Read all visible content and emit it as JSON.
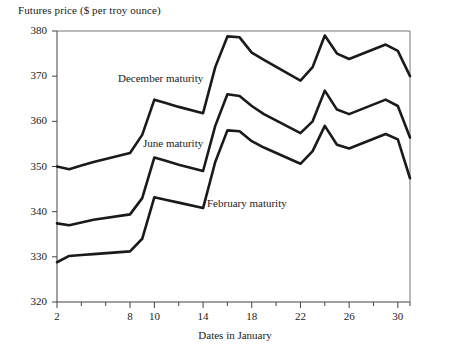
{
  "chart_data": {
    "type": "line",
    "title": "",
    "ylabel": "Futures price ($ per troy ounce)",
    "xlabel": "Dates in January",
    "ylim": [
      320,
      380
    ],
    "xlim": [
      2,
      31
    ],
    "grid": false,
    "legend_position": "inline-annotation",
    "yticks": [
      320,
      330,
      340,
      350,
      360,
      370,
      380
    ],
    "xticks": [
      2,
      8,
      10,
      14,
      18,
      22,
      26,
      30
    ],
    "x_minor_ticks": [
      4,
      6,
      12,
      16,
      20,
      24,
      28,
      31
    ],
    "x": [
      2,
      3,
      4,
      5,
      8,
      9,
      10,
      11,
      12,
      14,
      15,
      16,
      17,
      18,
      19,
      22,
      23,
      24,
      25,
      26,
      29,
      30,
      31
    ],
    "series": [
      {
        "name": "December maturity",
        "label": "December maturity",
        "color": "#1a1a1a",
        "values": [
          350.0,
          349.4,
          350.2,
          351.0,
          353.0,
          357.0,
          364.8,
          364.0,
          363.2,
          361.8,
          372.0,
          378.8,
          378.6,
          375.2,
          373.6,
          369.0,
          372.0,
          379.0,
          375.0,
          373.8,
          377.0,
          375.6,
          370.0
        ]
      },
      {
        "name": "June maturity",
        "label": "June maturity",
        "color": "#1a1a1a",
        "values": [
          337.4,
          337.0,
          337.6,
          338.2,
          339.4,
          343.0,
          352.0,
          351.2,
          350.4,
          349.0,
          359.0,
          366.0,
          365.6,
          363.4,
          361.6,
          357.4,
          360.0,
          366.8,
          362.6,
          361.6,
          364.8,
          363.4,
          356.4
        ]
      },
      {
        "name": "February maturity",
        "label": "February maturity",
        "color": "#1a1a1a",
        "values": [
          328.8,
          330.2,
          330.4,
          330.6,
          331.2,
          334.0,
          343.2,
          342.6,
          342.0,
          340.8,
          351.0,
          358.0,
          357.8,
          355.6,
          354.2,
          350.6,
          353.4,
          359.0,
          354.8,
          354.0,
          357.2,
          356.0,
          347.4
        ]
      }
    ],
    "annotations": [
      {
        "text": "December maturity",
        "x_px": 118,
        "y_px": 72
      },
      {
        "text": "June maturity",
        "x_px": 143,
        "y_px": 137
      },
      {
        "text": "February maturity",
        "x_px": 207,
        "y_px": 197
      }
    ]
  },
  "axis": {
    "y_tick_labels": [
      "380",
      "370",
      "360",
      "350",
      "340",
      "330",
      "320"
    ],
    "x_tick_labels": [
      "2",
      "8",
      "10",
      "14",
      "18",
      "22",
      "26",
      "30"
    ]
  }
}
